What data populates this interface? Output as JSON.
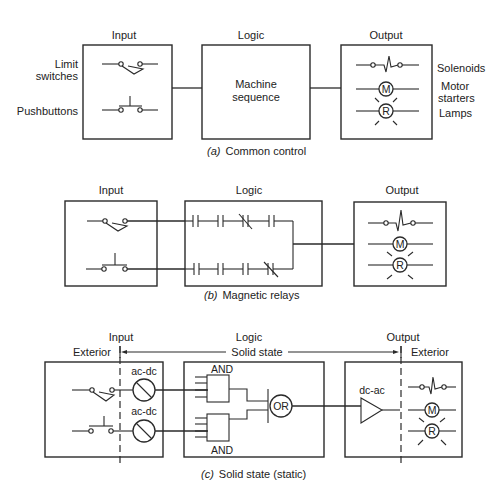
{
  "panel_a": {
    "headers": {
      "input": "Input",
      "logic": "Logic",
      "output": "Output"
    },
    "input_labels": {
      "limit_1": "Limit",
      "limit_2": "switches",
      "pushbuttons": "Pushbuttons"
    },
    "logic_text": {
      "line1": "Machine",
      "line2": "sequence"
    },
    "output_labels": {
      "solenoids": "Solenoids",
      "motor_1": "Motor",
      "motor_2": "starters",
      "lamps": "Lamps"
    },
    "symbols": {
      "motor": "M",
      "lamp": "R"
    },
    "caption": {
      "letter": "(a)",
      "text": "Common control"
    }
  },
  "panel_b": {
    "headers": {
      "input": "Input",
      "logic": "Logic",
      "output": "Output"
    },
    "symbols": {
      "motor": "M",
      "lamp": "R"
    },
    "caption": {
      "letter": "(b)",
      "text": "Magnetic relays"
    }
  },
  "panel_c": {
    "headers": {
      "input": "Input",
      "logic": "Logic",
      "output": "Output"
    },
    "exterior_left": "Exterior",
    "exterior_right": "Exterior",
    "span_label": "Solid state",
    "converters": {
      "top": "ac-dc",
      "bottom": "ac-dc",
      "output": "dc-ac"
    },
    "gates": {
      "and_top": "AND",
      "and_bottom": "AND",
      "or": "OR"
    },
    "symbols": {
      "motor": "M",
      "lamp": "R"
    },
    "caption": {
      "letter": "(c)",
      "text": "Solid state (static)"
    }
  }
}
